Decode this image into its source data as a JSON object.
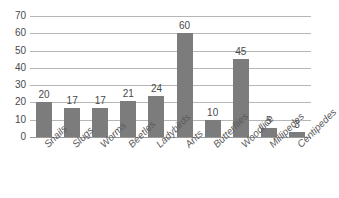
{
  "chart_data": {
    "type": "bar",
    "title": "",
    "subtitle": "",
    "xlabel": "",
    "ylabel": "",
    "categories": [
      "Snails",
      "Slugs",
      "Worms",
      "Beetles",
      "Ladybirds",
      "Ants",
      "Butterflies",
      "Woodlice",
      "Millipedes",
      "Centipedes"
    ],
    "values": [
      20,
      17,
      17,
      21,
      24,
      60,
      10,
      45,
      5,
      3
    ],
    "data_labels": [
      "20",
      "17",
      "17",
      "21",
      "24",
      "60",
      "10",
      "45",
      "5",
      "3"
    ],
    "ylim": [
      0,
      70
    ],
    "ytick_labels": [
      "70",
      "60",
      "50",
      "40",
      "30",
      "20",
      "10",
      "0"
    ],
    "ytick_values": [
      70,
      60,
      50,
      40,
      30,
      20,
      10,
      0
    ],
    "grid": true,
    "grid_axis": "y",
    "legend": false,
    "legend_position": "none",
    "bar_color": "#7c7c7c",
    "gridline_color": "#b6b6b6",
    "axis_color": "#9a9a9a",
    "label_color": "#4a4a4a",
    "category_label_color": "#5a5a5a",
    "background_color": "#ffffff",
    "category_label_rotation": -45
  }
}
